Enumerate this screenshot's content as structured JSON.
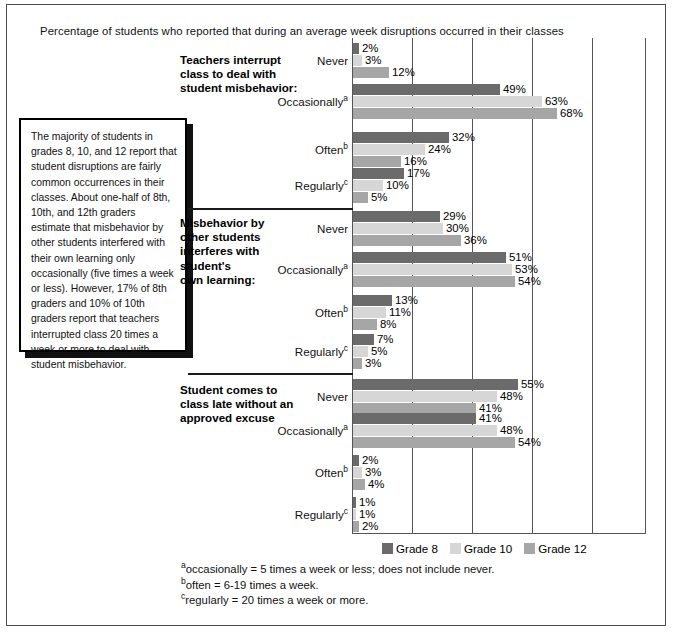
{
  "title": "Percentage of students who reported that during an average week disruptions occurred in their classes",
  "callout": {
    "text": "The majority of students in grades 8, 10, and 12 report that student disruptions are fairly common occurrences in their classes. About one-half of 8th, 10th, and 12th graders estimate that misbehavior by other students interfered with their own learning only occasionally (five times a week or less). However, 17% of 8th graders and 10% of 10th graders report that teachers interrupted class 20 times a week or more to deal with student misbehavior."
  },
  "legend": {
    "items": [
      {
        "label": "Grade 8",
        "color": "#6b6b6b"
      },
      {
        "label": "Grade 10",
        "color": "#d6d6d6"
      },
      {
        "label": "Grade 12",
        "color": "#a6a6a6"
      }
    ]
  },
  "footnotes": [
    {
      "marker": "a",
      "text": "occasionally = 5 times a week or less; does not include never."
    },
    {
      "marker": "b",
      "text": "often = 6-19 times a week."
    },
    {
      "marker": "c",
      "text": "regularly = 20 times a week or more."
    }
  ],
  "categories": [
    {
      "label": "Never",
      "marker": ""
    },
    {
      "label": "Occasionally",
      "marker": "a"
    },
    {
      "label": "Often",
      "marker": "b"
    },
    {
      "label": "Regularly",
      "marker": "c"
    }
  ],
  "group_headings": [
    "Teachers interrupt\nclass to deal with\nstudent misbehavior:",
    "Misbehavior by\nother students\ninterferes with\nstudent's\nown learning:",
    "Student comes to\nclass late without an\napproved excuse"
  ],
  "values": {
    "g0": {
      "Never": {
        "g8": "2%",
        "g10": "3%",
        "g12": "12%"
      },
      "Occasionally": {
        "g8": "49%",
        "g10": "63%",
        "g12": "68%"
      },
      "Often": {
        "g8": "32%",
        "g10": "24%",
        "g12": "16%"
      },
      "Regularly": {
        "g8": "17%",
        "g10": "10%",
        "g12": "5%"
      }
    },
    "g1": {
      "Never": {
        "g8": "29%",
        "g10": "30%",
        "g12": "36%"
      },
      "Occasionally": {
        "g8": "51%",
        "g10": "53%",
        "g12": "54%"
      },
      "Often": {
        "g8": "13%",
        "g10": "11%",
        "g12": "8%"
      },
      "Regularly": {
        "g8": "7%",
        "g10": "5%",
        "g12": "3%"
      }
    },
    "g2": {
      "Never": {
        "g8": "55%",
        "g10": "48%",
        "g12": "41%"
      },
      "Occasionally": {
        "g8": "41%",
        "g10": "48%",
        "g12": "54%"
      },
      "Often": {
        "g8": "2%",
        "g10": "3%",
        "g12": "4%"
      },
      "Regularly": {
        "g8": "1%",
        "g10": "1%",
        "g12": "2%"
      }
    }
  },
  "chart_data": {
    "type": "bar",
    "orientation": "horizontal",
    "title": "Percentage of students who reported that during an average week disruptions occurred in their classes",
    "xlabel": "",
    "ylabel": "",
    "xlim": [
      0,
      98
    ],
    "grid": true,
    "gridlines_every": 20,
    "legend_position": "bottom",
    "series_names": [
      "Grade 8",
      "Grade 10",
      "Grade 12"
    ],
    "series_colors": [
      "#6b6b6b",
      "#d6d6d6",
      "#a6a6a6"
    ],
    "panels": [
      {
        "heading": "Teachers interrupt class to deal with student misbehavior:",
        "categories": [
          "Never",
          "Occasionally",
          "Often",
          "Regularly"
        ],
        "series": [
          {
            "name": "Grade 8",
            "values": [
              2,
              49,
              32,
              17
            ]
          },
          {
            "name": "Grade 10",
            "values": [
              3,
              63,
              24,
              10
            ]
          },
          {
            "name": "Grade 12",
            "values": [
              12,
              68,
              16,
              5
            ]
          }
        ]
      },
      {
        "heading": "Misbehavior by other students interferes with student's own learning:",
        "categories": [
          "Never",
          "Occasionally",
          "Often",
          "Regularly"
        ],
        "series": [
          {
            "name": "Grade 8",
            "values": [
              29,
              51,
              13,
              7
            ]
          },
          {
            "name": "Grade 10",
            "values": [
              30,
              53,
              11,
              5
            ]
          },
          {
            "name": "Grade 12",
            "values": [
              36,
              54,
              8,
              3
            ]
          }
        ]
      },
      {
        "heading": "Student comes to class late without an approved excuse",
        "categories": [
          "Never",
          "Occasionally",
          "Often",
          "Regularly"
        ],
        "series": [
          {
            "name": "Grade 8",
            "values": [
              55,
              41,
              2,
              1
            ]
          },
          {
            "name": "Grade 10",
            "values": [
              48,
              48,
              3,
              1
            ]
          },
          {
            "name": "Grade 12",
            "values": [
              41,
              54,
              4,
              2
            ]
          }
        ]
      }
    ]
  }
}
